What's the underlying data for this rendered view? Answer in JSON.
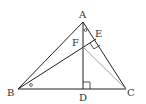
{
  "figure": {
    "type": "geometry-triangle",
    "points": {
      "A": {
        "label": "A",
        "x": 83,
        "y": 22
      },
      "B": {
        "label": "B",
        "x": 18,
        "y": 89
      },
      "C": {
        "label": "C",
        "x": 126,
        "y": 89
      },
      "D": {
        "label": "D",
        "x": 83,
        "y": 89
      },
      "E": {
        "label": "E",
        "x": 96,
        "y": 39
      },
      "F": {
        "label": "F",
        "x": 83,
        "y": 47
      }
    },
    "segments": [
      "AB",
      "AC",
      "BC",
      "AD",
      "BE",
      "FC"
    ],
    "right_angles": [
      "D",
      "E"
    ],
    "equal_angle_marks": [
      "BAD (at A)",
      "ABE (at B)"
    ],
    "colors": {
      "stroke": "#222222",
      "light_stroke": "#888888"
    }
  }
}
